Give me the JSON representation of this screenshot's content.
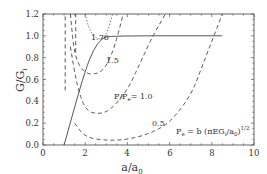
{
  "chart_data": {
    "type": "line",
    "title": "",
    "xlabel": "a/a0",
    "ylabel": "G/Gi",
    "xlim": [
      0,
      10
    ],
    "ylim": [
      0,
      1.2
    ],
    "xticks": [
      "0",
      "2",
      "4",
      "6",
      "8",
      "10"
    ],
    "yticks": [
      "0.0",
      "0.2",
      "0.4",
      "0.6",
      "0.8",
      "1.0",
      "1.2"
    ],
    "grid": false,
    "series": [
      {
        "name": "G/Gi envelope (solid)",
        "style": "solid",
        "x": [
          1.0,
          1.5,
          2.0,
          2.4,
          2.8,
          3.2,
          8.5
        ],
        "y": [
          0.0,
          0.35,
          0.68,
          0.88,
          0.98,
          1.0,
          1.0
        ]
      },
      {
        "name": "P/Pe = 0.5",
        "style": "dashed",
        "x": [
          1.5,
          2.0,
          3.0,
          4.0,
          5.0,
          6.0,
          7.0,
          7.5,
          8.0,
          8.5
        ],
        "y": [
          0.2,
          0.07,
          0.04,
          0.05,
          0.1,
          0.2,
          0.45,
          0.7,
          0.95,
          1.2
        ]
      },
      {
        "name": "P/Pe = 1.0",
        "style": "dashed",
        "x": [
          1.3,
          1.6,
          2.0,
          2.6,
          3.2,
          4.0,
          4.6,
          5.2,
          5.8
        ],
        "y": [
          0.9,
          0.55,
          0.32,
          0.28,
          0.32,
          0.5,
          0.75,
          1.0,
          1.2
        ]
      },
      {
        "name": "P/Pe = 1.5",
        "style": "dashed",
        "x": [
          1.3,
          1.5,
          2.0,
          2.6,
          3.0,
          3.4,
          3.8
        ],
        "y": [
          1.2,
          0.8,
          0.65,
          0.65,
          0.72,
          0.9,
          1.2
        ]
      },
      {
        "name": "P/Pe = 1.76",
        "style": "dotted",
        "x": [
          2.0,
          2.2,
          2.6,
          3.0,
          3.3
        ],
        "y": [
          1.2,
          1.05,
          0.96,
          1.0,
          1.2
        ]
      },
      {
        "name": "steep left branch 1",
        "style": "dashed",
        "x": [
          1.05,
          1.05
        ],
        "y": [
          0.5,
          1.2
        ]
      },
      {
        "name": "steep left branch 2",
        "style": "dashed",
        "x": [
          1.55,
          1.55
        ],
        "y": [
          0.85,
          1.2
        ]
      }
    ],
    "annotations": [
      "1.76",
      "1.5",
      "P/Pe = 1.0",
      "0.5",
      "Pe = b (πEGi/a0)^1/2"
    ]
  },
  "labels": {
    "y_axis_main": "G/G",
    "y_axis_sub": "i",
    "x_axis_main": "a/a",
    "x_axis_sub": "0",
    "ann_176": "1.76",
    "ann_15": "1.5",
    "ann_10": "P/P",
    "ann_10_sub": "e",
    "ann_10_val": "= 1.0",
    "ann_05": "0.5",
    "formula_a": "P",
    "formula_a_sub": "e",
    "formula_b": " = b (πEG",
    "formula_b_sub": "i",
    "formula_c": "/a",
    "formula_c_sub": "0",
    "formula_d": ")",
    "formula_sup": "1/2"
  },
  "ticks": {
    "x": [
      "0",
      "2",
      "4",
      "6",
      "8",
      "10"
    ],
    "y": [
      "0.0",
      "0.2",
      "0.4",
      "0.6",
      "0.8",
      "1.0",
      "1.2"
    ]
  }
}
